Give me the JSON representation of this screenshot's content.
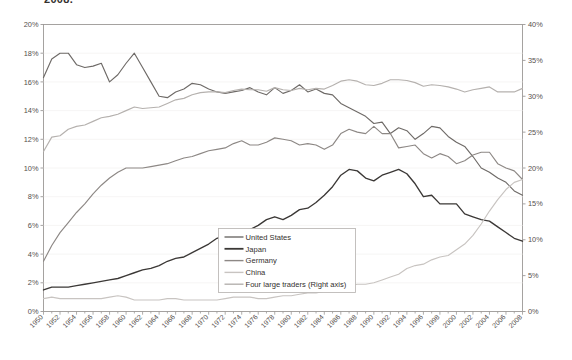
{
  "caption": "2008.",
  "chart_data": {
    "type": "line",
    "title": "2008.",
    "xlabel": "",
    "ylabel": "",
    "grid": false,
    "legend_position": "inside-bottom-center",
    "x_start": 1950,
    "x_end": 2008,
    "x_tick_step": 2,
    "x_tick_labels": [
      "1950",
      "1952",
      "1954",
      "1956",
      "1958",
      "1960",
      "1962",
      "1964",
      "1966",
      "1968",
      "1970",
      "1972",
      "1974",
      "1976",
      "1978",
      "1980",
      "1982",
      "1984",
      "1986",
      "1988",
      "1990",
      "1992",
      "1994",
      "1996",
      "1998",
      "2000",
      "2002",
      "2004",
      "2006",
      "2008"
    ],
    "left_axis": {
      "min": 0,
      "max": 20,
      "step": 2,
      "tick_labels": [
        "0%",
        "2%",
        "4%",
        "6%",
        "8%",
        "10%",
        "12%",
        "14%",
        "16%",
        "18%",
        "20%"
      ]
    },
    "right_axis": {
      "min": 0,
      "max": 40,
      "step": 5,
      "tick_labels": [
        "0%",
        "5%",
        "10%",
        "15%",
        "20%",
        "25%",
        "30%",
        "35%",
        "40%"
      ]
    },
    "x": [
      1950,
      1951,
      1952,
      1953,
      1954,
      1955,
      1956,
      1957,
      1958,
      1959,
      1960,
      1961,
      1962,
      1963,
      1964,
      1965,
      1966,
      1967,
      1968,
      1969,
      1970,
      1971,
      1972,
      1973,
      1974,
      1975,
      1976,
      1977,
      1978,
      1979,
      1980,
      1981,
      1982,
      1983,
      1984,
      1985,
      1986,
      1987,
      1988,
      1989,
      1990,
      1991,
      1992,
      1993,
      1994,
      1995,
      1996,
      1997,
      1998,
      1999,
      2000,
      2001,
      2002,
      2003,
      2004,
      2005,
      2006,
      2007,
      2008
    ],
    "series": [
      {
        "name": "United States",
        "axis": "left",
        "color": "#6e6a67",
        "values": [
          16.3,
          17.6,
          18.0,
          18.0,
          17.2,
          17.0,
          17.1,
          17.3,
          16.0,
          16.5,
          17.3,
          18.0,
          17.0,
          16.0,
          15.0,
          14.9,
          15.3,
          15.5,
          15.9,
          15.8,
          15.5,
          15.3,
          15.2,
          15.3,
          15.4,
          15.6,
          15.3,
          15.1,
          15.6,
          15.2,
          15.4,
          15.8,
          15.3,
          15.5,
          15.2,
          15.1,
          14.5,
          14.2,
          13.9,
          13.6,
          13.1,
          13.2,
          12.4,
          12.8,
          12.6,
          12.0,
          12.4,
          12.9,
          12.8,
          12.2,
          11.8,
          11.5,
          10.8,
          10.0,
          9.7,
          9.3,
          9.0,
          8.4,
          8.1
        ]
      },
      {
        "name": "Japan",
        "axis": "left",
        "color": "#3b3836",
        "values": [
          1.5,
          1.7,
          1.7,
          1.7,
          1.8,
          1.9,
          2.0,
          2.1,
          2.2,
          2.3,
          2.5,
          2.7,
          2.9,
          3.0,
          3.2,
          3.5,
          3.7,
          3.8,
          4.1,
          4.4,
          4.7,
          5.1,
          5.3,
          5.2,
          5.5,
          5.7,
          6.0,
          6.4,
          6.6,
          6.4,
          6.7,
          7.1,
          7.2,
          7.6,
          8.1,
          8.7,
          9.5,
          9.9,
          9.8,
          9.3,
          9.1,
          9.5,
          9.7,
          9.9,
          9.6,
          8.9,
          8.0,
          8.1,
          7.5,
          7.5,
          7.5,
          6.8,
          6.6,
          6.4,
          6.3,
          5.9,
          5.5,
          5.1,
          4.9
        ]
      },
      {
        "name": "Germany",
        "axis": "left",
        "color": "#8d8885",
        "values": [
          3.5,
          4.6,
          5.5,
          6.2,
          6.9,
          7.5,
          8.2,
          8.8,
          9.3,
          9.7,
          10.0,
          10.0,
          10.0,
          10.1,
          10.2,
          10.3,
          10.5,
          10.7,
          10.8,
          11.0,
          11.2,
          11.3,
          11.4,
          11.7,
          11.9,
          11.6,
          11.6,
          11.8,
          12.1,
          12.0,
          11.9,
          11.6,
          11.7,
          11.6,
          11.3,
          11.6,
          12.4,
          12.7,
          12.5,
          12.4,
          12.9,
          12.4,
          12.4,
          11.4,
          11.5,
          11.6,
          11.0,
          10.7,
          11.0,
          10.8,
          10.3,
          10.5,
          10.9,
          11.1,
          11.1,
          10.3,
          10.0,
          9.8,
          9.2
        ]
      },
      {
        "name": "China",
        "axis": "left",
        "color": "#c8c4c1",
        "values": [
          0.9,
          1.0,
          0.9,
          0.9,
          0.9,
          0.9,
          0.9,
          0.9,
          1.0,
          1.1,
          1.0,
          0.8,
          0.8,
          0.8,
          0.8,
          0.9,
          0.9,
          0.8,
          0.8,
          0.8,
          0.8,
          0.8,
          0.9,
          1.0,
          1.0,
          1.0,
          0.9,
          0.9,
          1.0,
          1.1,
          1.1,
          1.2,
          1.3,
          1.3,
          1.4,
          1.6,
          1.7,
          1.8,
          1.9,
          1.9,
          2.0,
          2.2,
          2.4,
          2.6,
          3.0,
          3.2,
          3.3,
          3.6,
          3.8,
          3.9,
          4.3,
          4.7,
          5.3,
          6.1,
          7.0,
          7.8,
          8.5,
          9.0,
          9.2
        ]
      },
      {
        "name": "Four large traders  (Right axis)",
        "axis": "right",
        "color": "#b5b1ae",
        "values": [
          22.3,
          24.3,
          24.5,
          25.4,
          25.8,
          26.0,
          26.5,
          27.0,
          27.2,
          27.5,
          28.0,
          28.5,
          28.3,
          28.4,
          28.5,
          29.0,
          29.5,
          29.7,
          30.2,
          30.5,
          30.6,
          30.6,
          30.5,
          30.8,
          31.0,
          30.9,
          30.9,
          30.7,
          31.2,
          30.9,
          30.8,
          31.1,
          30.9,
          31.1,
          31.0,
          31.5,
          32.1,
          32.3,
          32.1,
          31.6,
          31.5,
          31.8,
          32.3,
          32.3,
          32.2,
          31.9,
          31.4,
          31.6,
          31.5,
          31.3,
          31.0,
          30.6,
          30.9,
          31.1,
          31.3,
          30.6,
          30.6,
          30.6,
          31.1
        ]
      }
    ],
    "legend_entries": [
      {
        "label": "United States",
        "color": "#6e6a67"
      },
      {
        "label": "Japan",
        "color": "#3b3836"
      },
      {
        "label": "Germany",
        "color": "#8d8885"
      },
      {
        "label": "China",
        "color": "#c8c4c1"
      },
      {
        "label": "Four large traders  (Right axis)",
        "color": "#b5b1ae"
      }
    ]
  }
}
